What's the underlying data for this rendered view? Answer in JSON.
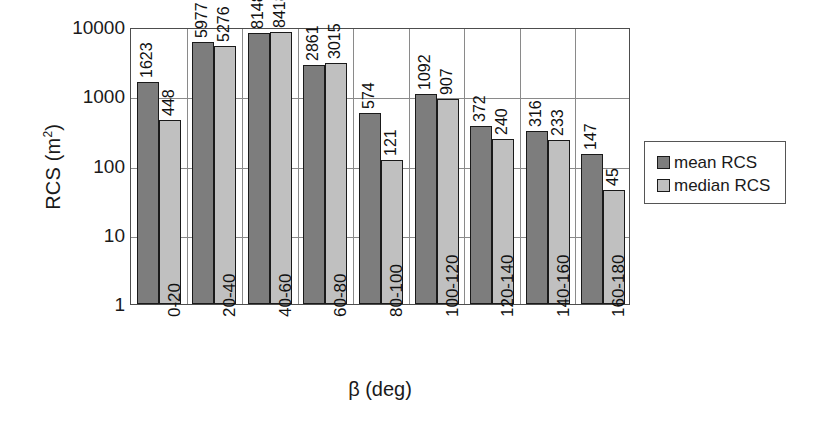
{
  "chart_data": {
    "type": "bar",
    "title": "",
    "xlabel": "β (deg)",
    "ylabel": "RCS (m²)",
    "yscale": "log",
    "ylim": [
      1,
      10000
    ],
    "yticks": [
      10000,
      1000,
      100,
      10,
      1
    ],
    "ytick_labels": [
      "10000",
      "1000",
      "100",
      "10",
      "1"
    ],
    "grid": true,
    "legend_position": "right",
    "categories": [
      "0-20",
      "20-40",
      "40-60",
      "60-80",
      "80-100",
      "100-120",
      "120-140",
      "140-160",
      "160-180"
    ],
    "series": [
      {
        "name": "mean RCS",
        "color": "#7d7d7d",
        "values": [
          1623,
          5977,
          8148,
          2861,
          574,
          1092,
          372,
          316,
          147
        ]
      },
      {
        "name": "median RCS",
        "color": "#c0c0c0",
        "values": [
          448,
          5276,
          8418,
          3015,
          121,
          907,
          240,
          233,
          45
        ]
      }
    ]
  },
  "axes": {
    "y_title_main": "RCS (m",
    "y_title_sup": "2",
    "y_title_close": ")",
    "x_title": "β (deg)"
  },
  "legend": {
    "items": [
      {
        "label": "mean RCS",
        "swatch": "mean"
      },
      {
        "label": "median RCS",
        "swatch": "median"
      }
    ]
  }
}
